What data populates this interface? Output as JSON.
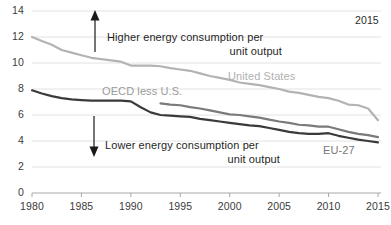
{
  "chart_data": {
    "type": "line",
    "title": "",
    "subtitle": "",
    "xlabel": "",
    "ylabel": "",
    "xlim": [
      1980,
      2015
    ],
    "ylim": [
      0,
      14
    ],
    "grid": true,
    "grid_axis": "y",
    "legend_position": "inline-labels",
    "y_ticks": [
      "0",
      "2",
      "4",
      "6",
      "8",
      "10",
      "12",
      "14"
    ],
    "y_tick_values": [
      0,
      2,
      4,
      6,
      8,
      10,
      12,
      14
    ],
    "x_ticks": [
      "1980",
      "1985",
      "1990",
      "1995",
      "2000",
      "2005",
      "2010",
      "2015"
    ],
    "x_tick_values": [
      1980,
      1985,
      1990,
      1995,
      2000,
      2005,
      2010,
      2015
    ],
    "series": [
      {
        "name": "United States",
        "color": "#b3b3b3",
        "label_color": "#b0b0b0",
        "x": [
          1980,
          1981,
          1982,
          1983,
          1984,
          1985,
          1986,
          1987,
          1988,
          1989,
          1990,
          1991,
          1992,
          1993,
          1994,
          1995,
          1996,
          1997,
          1998,
          1999,
          2000,
          2001,
          2002,
          2003,
          2004,
          2005,
          2006,
          2007,
          2008,
          2009,
          2010,
          2011,
          2012,
          2013,
          2014,
          2015
        ],
        "values": [
          12.0,
          11.7,
          11.4,
          11.0,
          10.8,
          10.6,
          10.4,
          10.3,
          10.2,
          10.1,
          9.8,
          9.8,
          9.8,
          9.75,
          9.6,
          9.5,
          9.4,
          9.2,
          9.0,
          8.85,
          8.7,
          8.5,
          8.4,
          8.3,
          8.15,
          8.0,
          7.8,
          7.7,
          7.55,
          7.4,
          7.3,
          7.1,
          6.8,
          6.75,
          6.5,
          5.6
        ]
      },
      {
        "name": "OECD less U.S.",
        "color": "#7a7a7a",
        "label_color": "#9a9a9a",
        "x": [
          1993,
          1994,
          1995,
          1996,
          1997,
          1998,
          1999,
          2000,
          2001,
          2002,
          2003,
          2004,
          2005,
          2006,
          2007,
          2008,
          2009,
          2010,
          2011,
          2012,
          2013,
          2014,
          2015
        ],
        "values": [
          6.9,
          6.8,
          6.75,
          6.6,
          6.5,
          6.35,
          6.2,
          6.05,
          6.0,
          5.9,
          5.8,
          5.65,
          5.5,
          5.4,
          5.25,
          5.2,
          5.1,
          5.1,
          4.9,
          4.7,
          4.55,
          4.45,
          4.3
        ]
      },
      {
        "name": "EU-27",
        "color": "#3a3a3a",
        "label_color": "#787878",
        "x": [
          1980,
          1981,
          1982,
          1983,
          1984,
          1985,
          1986,
          1987,
          1988,
          1989,
          1990,
          1991,
          1992,
          1993,
          1994,
          1995,
          1996,
          1997,
          1998,
          1999,
          2000,
          2001,
          2002,
          2003,
          2004,
          2005,
          2006,
          2007,
          2008,
          2009,
          2010,
          2011,
          2012,
          2013,
          2014,
          2015
        ],
        "values": [
          7.9,
          7.65,
          7.45,
          7.3,
          7.2,
          7.15,
          7.1,
          7.1,
          7.1,
          7.1,
          7.05,
          6.6,
          6.2,
          6.0,
          5.95,
          5.9,
          5.85,
          5.7,
          5.6,
          5.5,
          5.4,
          5.3,
          5.2,
          5.15,
          5.0,
          4.85,
          4.7,
          4.6,
          4.55,
          4.55,
          4.6,
          4.4,
          4.25,
          4.1,
          4.0,
          3.9
        ]
      }
    ],
    "annotations": [
      {
        "id": "up-arrow-note",
        "text_line1": "Higher energy consumption per",
        "text_line2": "unit output",
        "arrow": "up"
      },
      {
        "id": "down-arrow-note",
        "text_line1": "Lower energy consumption per",
        "text_line2": "unit output",
        "arrow": "down"
      },
      {
        "id": "corner-year",
        "text": "2015"
      }
    ]
  },
  "labels": {
    "united_states": "United States",
    "oecd_less_us": "OECD less U.S.",
    "eu27": "EU-27",
    "year_note": "2015",
    "higher_line1": "Higher energy consumption per",
    "higher_line2": "unit output",
    "lower_line1": "Lower energy consumption per",
    "lower_line2": "unit output"
  },
  "colors": {
    "united_states": "#b3b3b3",
    "oecd_less_us": "#7a7a7a",
    "eu27": "#3a3a3a",
    "gridline": "#e2e2e2",
    "axis": "#9a9a9a",
    "text": "#3b3b3b"
  }
}
